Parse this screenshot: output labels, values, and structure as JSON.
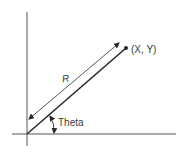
{
  "diagram": {
    "type": "polar-coordinates",
    "labels": {
      "point": "(X, Y)",
      "radius": "R",
      "angle": "Theta"
    },
    "colors": {
      "line": "#2a2a2a",
      "axis": "#555555",
      "text": "#3a3a3a",
      "background": "#ffffff"
    }
  }
}
